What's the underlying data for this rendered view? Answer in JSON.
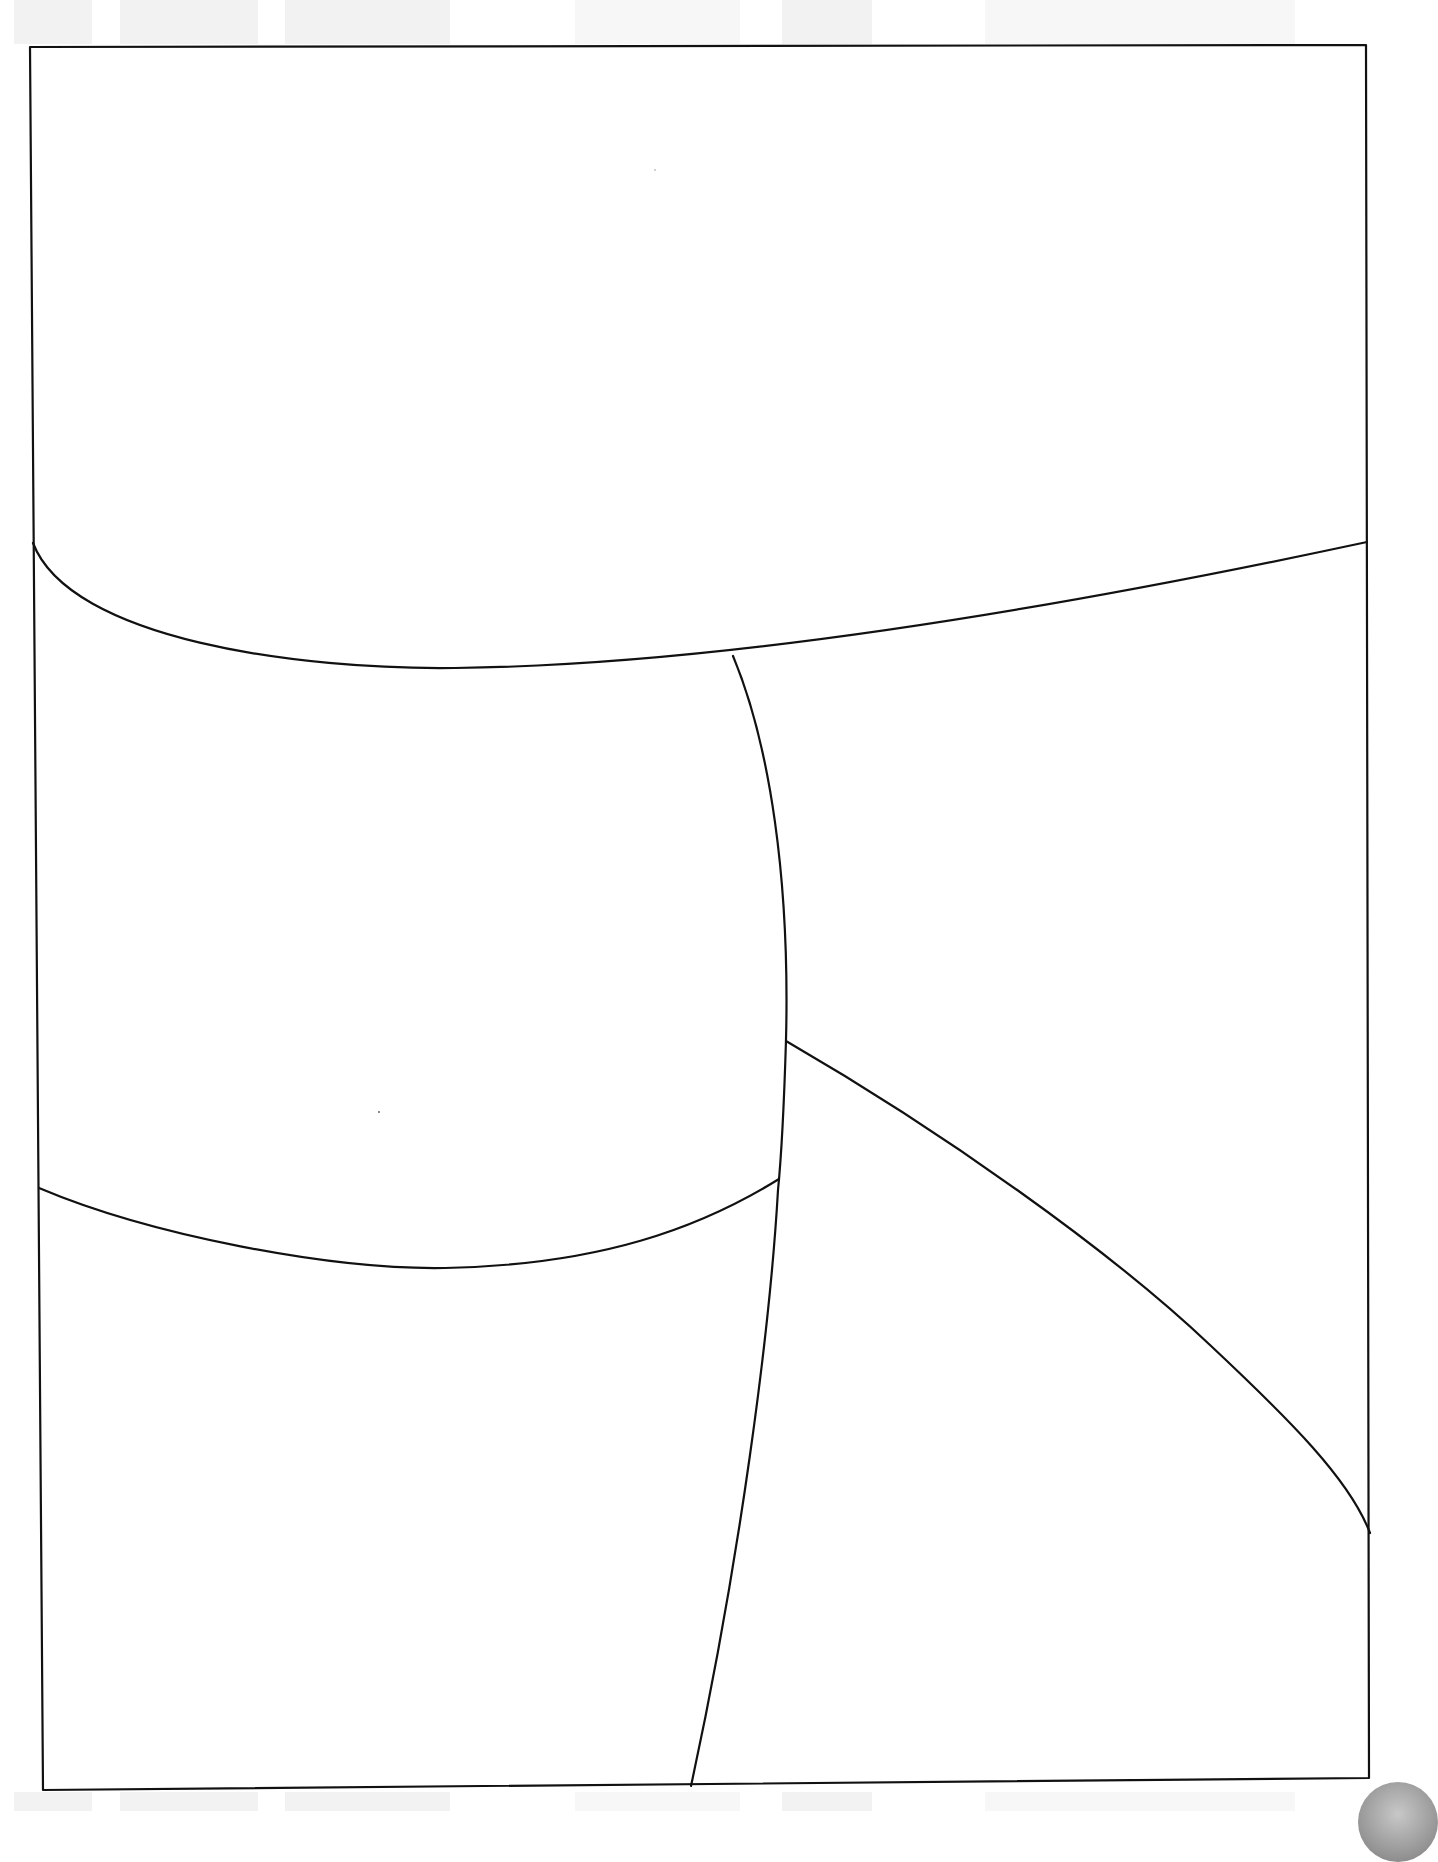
{
  "page": {
    "type": "blank comic panel layout template (scanned)",
    "background_color": "#ffffff",
    "line_color": "#111111",
    "panel_count": 5
  },
  "frame": {
    "x1": 30,
    "y1": 47,
    "x2": 1367,
    "y2": 1790
  },
  "panels": [
    {
      "id": 1,
      "position": "top (wide)"
    },
    {
      "id": 2,
      "position": "middle-left"
    },
    {
      "id": 3,
      "position": "middle-right"
    },
    {
      "id": 4,
      "position": "bottom-left"
    },
    {
      "id": 5,
      "position": "bottom-right"
    }
  ],
  "bleed_through": {
    "top_blocks": 4,
    "bottom_blocks": 4,
    "color": "#e9e9e9"
  }
}
